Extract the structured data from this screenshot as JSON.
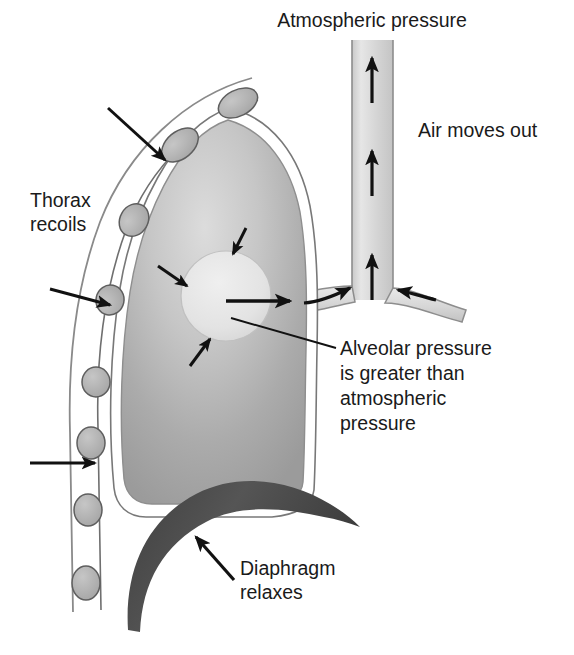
{
  "figure": {
    "title_visible": false,
    "background_color": "#ffffff"
  },
  "colors": {
    "outline": "#1a1a1a",
    "text": "#1a1a1a",
    "lung_light": "#d2d2d2",
    "lung_mid": "#b6b6b6",
    "lung_dark": "#9a9a9a",
    "rib_fill": "#b4b4b4",
    "rib_stroke": "#5a5a5a",
    "airway_fill": "#d8d8d8",
    "airway_light": "#ececec",
    "alveolus_fill": "#e4e4e4",
    "diaphragm": "#4a4a4a",
    "pleura": "#ffffff",
    "thorax_wall_line": "#6b6b6b"
  },
  "labels": {
    "atmospheric_pressure": {
      "text": "Atmospheric pressure",
      "x": 372,
      "y": 22,
      "anchor": "middle"
    },
    "air_moves_out": {
      "text": "Air moves out",
      "x": 418,
      "y": 137,
      "anchor": "start"
    },
    "thorax_recoils": {
      "lines": [
        "Thorax",
        "recoils"
      ],
      "x": 30,
      "y": 207,
      "anchor": "start",
      "line_height": 24
    },
    "alveolar_pressure": {
      "lines": [
        "Alveolar pressure",
        "is greater than",
        "atmospheric",
        "pressure"
      ],
      "x": 340,
      "y": 355,
      "anchor": "start",
      "line_height": 25
    },
    "diaphragm_relaxes": {
      "lines": [
        "Diaphragm",
        "relaxes"
      ],
      "x": 240,
      "y": 575,
      "anchor": "start",
      "line_height": 24
    }
  },
  "structures": {
    "trachea": {
      "name": "trachea",
      "left_x": 352,
      "right_x": 393,
      "top_y": 40,
      "branch_y": 292
    },
    "bronchus_left": {
      "name": "left-bronchus"
    },
    "bronchus_right": {
      "name": "right-bronchus"
    },
    "alveolus": {
      "name": "alveolus",
      "cx": 226,
      "cy": 296,
      "r": 45
    },
    "lung": {
      "name": "lung",
      "apex_y": 118
    },
    "diaphragm": {
      "name": "diaphragm"
    },
    "ribs_count": 7,
    "pleural_cavity": {
      "name": "pleural-cavity"
    }
  },
  "arrows": {
    "airflow_up": [
      {
        "name": "trachea-airflow-arrow-upper",
        "x": 372,
        "y1": 103,
        "y2": 58
      },
      {
        "name": "trachea-airflow-arrow-middle",
        "x": 372,
        "y1": 196,
        "y2": 151
      },
      {
        "name": "trachea-airflow-arrow-lower",
        "x": 372,
        "y1": 300,
        "y2": 255
      }
    ],
    "thorax_recoil": [
      {
        "name": "thorax-recoil-arrow-top",
        "x1": 108,
        "y1": 108,
        "x2": 165,
        "y2": 160
      },
      {
        "name": "thorax-recoil-arrow-middle",
        "x1": 50,
        "y1": 289,
        "x2": 108,
        "y2": 304
      },
      {
        "name": "thorax-recoil-arrow-lower",
        "x1": 30,
        "y1": 463,
        "x2": 93,
        "y2": 463
      }
    ],
    "alveolar_recoil": [
      {
        "name": "alveolar-recoil-arrow-top",
        "x1": 243,
        "y1": 231,
        "x2": 232,
        "y2": 253
      },
      {
        "name": "alveolar-recoil-arrow-left",
        "x1": 161,
        "y1": 268,
        "x2": 186,
        "y2": 285
      },
      {
        "name": "alveolar-recoil-arrow-bottom",
        "x1": 193,
        "y1": 363,
        "x2": 209,
        "y2": 339
      }
    ],
    "alveolar_outflow": {
      "name": "alveolar-outflow-arrow",
      "x1": 228,
      "y1": 300,
      "x2": 288,
      "y2": 300
    },
    "bronchus_flow_left": {
      "name": "left-bronchus-airflow-arrow",
      "x1": 303,
      "y1": 303,
      "x2": 352,
      "y2": 288
    },
    "bronchus_flow_right": {
      "name": "right-bronchus-airflow-arrow",
      "x1": 432,
      "y1": 297,
      "x2": 396,
      "y2": 290
    },
    "diaphragm_pointer": {
      "name": "diaphragm-pointer-arrow",
      "x1": 232,
      "y1": 578,
      "x2": 198,
      "y2": 540
    }
  },
  "leader_lines": {
    "alveolar_pressure_leader": {
      "name": "alveolar-pressure-leader-line",
      "x1": 232,
      "y1": 318,
      "x2": 336,
      "y2": 348
    }
  }
}
